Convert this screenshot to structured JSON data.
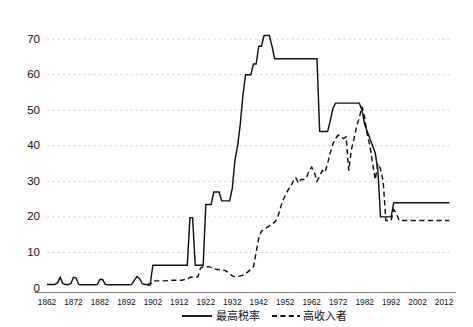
{
  "chart_data": {
    "type": "line",
    "title": "",
    "subtitle": "",
    "xlabel": "",
    "ylabel": "",
    "xlim": [
      1862,
      2015
    ],
    "ylim": [
      0,
      72
    ],
    "grid": true,
    "grid_axis": "y",
    "legend_position": "bottom-center",
    "y_ticks": [
      0,
      10,
      20,
      30,
      40,
      50,
      60,
      70
    ],
    "x_ticks": [
      1862,
      1872,
      1882,
      1892,
      1902,
      1912,
      1922,
      1932,
      1942,
      1952,
      1962,
      1972,
      1982,
      1992,
      2002,
      2012
    ],
    "series": [
      {
        "name": "最高税率",
        "style": "solid",
        "color": "#121212",
        "points": [
          [
            1862,
            1.0
          ],
          [
            1863,
            1.0
          ],
          [
            1864,
            1.0
          ],
          [
            1865,
            1.0
          ],
          [
            1866,
            1.5
          ],
          [
            1867,
            3.0
          ],
          [
            1868,
            1.2
          ],
          [
            1869,
            1.0
          ],
          [
            1870,
            1.0
          ],
          [
            1871,
            1.2
          ],
          [
            1872,
            3.0
          ],
          [
            1873,
            2.8
          ],
          [
            1874,
            1.0
          ],
          [
            1875,
            0.9
          ],
          [
            1876,
            0.9
          ],
          [
            1877,
            0.9
          ],
          [
            1878,
            0.9
          ],
          [
            1879,
            0.9
          ],
          [
            1880,
            0.9
          ],
          [
            1881,
            1.0
          ],
          [
            1882,
            2.4
          ],
          [
            1883,
            2.4
          ],
          [
            1884,
            1.0
          ],
          [
            1885,
            0.9
          ],
          [
            1886,
            0.9
          ],
          [
            1887,
            0.9
          ],
          [
            1888,
            0.9
          ],
          [
            1889,
            0.9
          ],
          [
            1890,
            0.9
          ],
          [
            1891,
            0.9
          ],
          [
            1892,
            0.9
          ],
          [
            1893,
            0.9
          ],
          [
            1894,
            1.0
          ],
          [
            1895,
            2.2
          ],
          [
            1896,
            3.2
          ],
          [
            1897,
            2.6
          ],
          [
            1898,
            1.2
          ],
          [
            1899,
            1.0
          ],
          [
            1900,
            1.0
          ],
          [
            1901,
            1.2
          ],
          [
            1902,
            6.4
          ],
          [
            1903,
            6.4
          ],
          [
            1904,
            6.4
          ],
          [
            1905,
            6.4
          ],
          [
            1906,
            6.4
          ],
          [
            1907,
            6.4
          ],
          [
            1908,
            6.4
          ],
          [
            1909,
            6.4
          ],
          [
            1910,
            6.4
          ],
          [
            1911,
            6.4
          ],
          [
            1912,
            6.4
          ],
          [
            1913,
            6.4
          ],
          [
            1914,
            6.4
          ],
          [
            1915,
            6.4
          ],
          [
            1916,
            19.8
          ],
          [
            1917,
            19.8
          ],
          [
            1918,
            6.4
          ],
          [
            1919,
            6.4
          ],
          [
            1920,
            6.4
          ],
          [
            1921,
            6.4
          ],
          [
            1922,
            23.5
          ],
          [
            1923,
            23.5
          ],
          [
            1924,
            23.5
          ],
          [
            1925,
            27.0
          ],
          [
            1926,
            27.0
          ],
          [
            1927,
            27.0
          ],
          [
            1928,
            24.5
          ],
          [
            1929,
            24.5
          ],
          [
            1930,
            24.5
          ],
          [
            1931,
            24.5
          ],
          [
            1932,
            28.0
          ],
          [
            1933,
            36.0
          ],
          [
            1934,
            40.0
          ],
          [
            1935,
            46.0
          ],
          [
            1936,
            54.0
          ],
          [
            1937,
            60.0
          ],
          [
            1938,
            60.0
          ],
          [
            1939,
            60.0
          ],
          [
            1940,
            63.0
          ],
          [
            1941,
            63.0
          ],
          [
            1942,
            68.0
          ],
          [
            1943,
            68.0
          ],
          [
            1944,
            71.0
          ],
          [
            1945,
            71.0
          ],
          [
            1946,
            71.0
          ],
          [
            1947,
            68.0
          ],
          [
            1948,
            64.5
          ],
          [
            1949,
            64.5
          ],
          [
            1950,
            64.5
          ],
          [
            1951,
            64.5
          ],
          [
            1952,
            64.5
          ],
          [
            1953,
            64.5
          ],
          [
            1954,
            64.5
          ],
          [
            1955,
            64.5
          ],
          [
            1956,
            64.5
          ],
          [
            1957,
            64.5
          ],
          [
            1958,
            64.5
          ],
          [
            1959,
            64.5
          ],
          [
            1960,
            64.5
          ],
          [
            1961,
            64.5
          ],
          [
            1962,
            64.5
          ],
          [
            1963,
            64.5
          ],
          [
            1964,
            64.5
          ],
          [
            1965,
            44.0
          ],
          [
            1966,
            44.0
          ],
          [
            1967,
            44.0
          ],
          [
            1968,
            44.0
          ],
          [
            1969,
            47.0
          ],
          [
            1970,
            50.5
          ],
          [
            1971,
            52.0
          ],
          [
            1972,
            52.0
          ],
          [
            1973,
            52.0
          ],
          [
            1974,
            52.0
          ],
          [
            1975,
            52.0
          ],
          [
            1976,
            52.0
          ],
          [
            1977,
            52.0
          ],
          [
            1978,
            52.0
          ],
          [
            1979,
            52.0
          ],
          [
            1980,
            52.0
          ],
          [
            1981,
            50.0
          ],
          [
            1982,
            46.0
          ],
          [
            1983,
            44.0
          ],
          [
            1984,
            42.0
          ],
          [
            1985,
            40.0
          ],
          [
            1986,
            38.0
          ],
          [
            1987,
            33.0
          ],
          [
            1988,
            20.0
          ],
          [
            1989,
            20.0
          ],
          [
            1990,
            20.0
          ],
          [
            1991,
            20.0
          ],
          [
            1992,
            20.0
          ],
          [
            1993,
            24.0
          ],
          [
            1994,
            24.0
          ],
          [
            1995,
            24.0
          ],
          [
            1996,
            24.0
          ],
          [
            1997,
            24.0
          ],
          [
            1998,
            24.0
          ],
          [
            1999,
            24.0
          ],
          [
            2000,
            24.0
          ],
          [
            2001,
            24.0
          ],
          [
            2002,
            24.0
          ],
          [
            2003,
            24.0
          ],
          [
            2004,
            24.0
          ],
          [
            2005,
            24.0
          ],
          [
            2006,
            24.0
          ],
          [
            2007,
            24.0
          ],
          [
            2008,
            24.0
          ],
          [
            2009,
            24.0
          ],
          [
            2010,
            24.0
          ],
          [
            2011,
            24.0
          ],
          [
            2012,
            24.0
          ],
          [
            2013,
            24.0
          ],
          [
            2014,
            24.0
          ]
        ]
      },
      {
        "name": "高收入者",
        "style": "dashed",
        "color": "#121212",
        "points": [
          [
            1900,
            0.8
          ],
          [
            1901,
            0.9
          ],
          [
            1902,
            2.0
          ],
          [
            1903,
            2.0
          ],
          [
            1904,
            2.0
          ],
          [
            1905,
            2.0
          ],
          [
            1906,
            2.0
          ],
          [
            1907,
            2.0
          ],
          [
            1908,
            2.2
          ],
          [
            1909,
            2.2
          ],
          [
            1910,
            2.2
          ],
          [
            1911,
            2.2
          ],
          [
            1912,
            2.2
          ],
          [
            1913,
            2.2
          ],
          [
            1914,
            2.4
          ],
          [
            1915,
            2.4
          ],
          [
            1916,
            3.0
          ],
          [
            1917,
            3.0
          ],
          [
            1918,
            3.0
          ],
          [
            1919,
            3.2
          ],
          [
            1920,
            5.6
          ],
          [
            1921,
            6.0
          ],
          [
            1922,
            6.0
          ],
          [
            1923,
            6.0
          ],
          [
            1924,
            5.8
          ],
          [
            1925,
            5.5
          ],
          [
            1926,
            5.2
          ],
          [
            1927,
            5.2
          ],
          [
            1928,
            5.0
          ],
          [
            1929,
            5.0
          ],
          [
            1930,
            4.6
          ],
          [
            1931,
            4.0
          ],
          [
            1932,
            3.4
          ],
          [
            1933,
            3.2
          ],
          [
            1934,
            3.2
          ],
          [
            1935,
            3.4
          ],
          [
            1936,
            3.6
          ],
          [
            1937,
            4.0
          ],
          [
            1938,
            4.6
          ],
          [
            1939,
            5.2
          ],
          [
            1940,
            6.0
          ],
          [
            1941,
            10.0
          ],
          [
            1942,
            14.0
          ],
          [
            1943,
            16.0
          ],
          [
            1944,
            16.5
          ],
          [
            1945,
            17.0
          ],
          [
            1946,
            17.5
          ],
          [
            1947,
            18.0
          ],
          [
            1948,
            18.5
          ],
          [
            1949,
            19.5
          ],
          [
            1950,
            22.0
          ],
          [
            1951,
            24.5
          ],
          [
            1952,
            26.0
          ],
          [
            1953,
            27.5
          ],
          [
            1954,
            28.5
          ],
          [
            1955,
            30.0
          ],
          [
            1956,
            31.0
          ],
          [
            1957,
            29.5
          ],
          [
            1958,
            30.5
          ],
          [
            1959,
            30.5
          ],
          [
            1960,
            31.0
          ],
          [
            1961,
            33.0
          ],
          [
            1962,
            34.0
          ],
          [
            1963,
            32.5
          ],
          [
            1964,
            30.0
          ],
          [
            1965,
            31.5
          ],
          [
            1966,
            33.0
          ],
          [
            1967,
            32.5
          ],
          [
            1968,
            35.0
          ],
          [
            1969,
            38.0
          ],
          [
            1970,
            40.5
          ],
          [
            1971,
            42.0
          ],
          [
            1972,
            43.0
          ],
          [
            1973,
            42.5
          ],
          [
            1974,
            42.0
          ],
          [
            1975,
            42.5
          ],
          [
            1976,
            33.0
          ],
          [
            1977,
            39.0
          ],
          [
            1978,
            42.0
          ],
          [
            1979,
            45.5
          ],
          [
            1980,
            48.0
          ],
          [
            1981,
            51.0
          ],
          [
            1982,
            48.0
          ],
          [
            1983,
            43.0
          ],
          [
            1984,
            40.0
          ],
          [
            1985,
            35.0
          ],
          [
            1986,
            30.5
          ],
          [
            1987,
            35.0
          ],
          [
            1988,
            33.5
          ],
          [
            1989,
            30.0
          ],
          [
            1990,
            19.0
          ],
          [
            1991,
            19.0
          ],
          [
            1992,
            19.0
          ],
          [
            1993,
            22.0
          ],
          [
            1994,
            21.0
          ],
          [
            1995,
            19.0
          ],
          [
            1996,
            19.0
          ],
          [
            1997,
            19.0
          ],
          [
            1998,
            19.0
          ],
          [
            1999,
            19.0
          ],
          [
            2000,
            19.0
          ],
          [
            2001,
            19.0
          ],
          [
            2002,
            19.0
          ],
          [
            2003,
            19.0
          ],
          [
            2004,
            19.0
          ],
          [
            2005,
            19.0
          ],
          [
            2006,
            19.0
          ],
          [
            2007,
            19.0
          ],
          [
            2008,
            19.0
          ],
          [
            2009,
            19.0
          ],
          [
            2010,
            19.0
          ],
          [
            2011,
            19.0
          ],
          [
            2012,
            19.0
          ],
          [
            2013,
            19.0
          ],
          [
            2014,
            19.0
          ]
        ]
      }
    ],
    "legend": [
      {
        "label": "最高税率",
        "style": "solid"
      },
      {
        "label": "高收入者",
        "style": "dashed"
      }
    ]
  },
  "axis": {
    "y_labels": [
      "0",
      "10",
      "20",
      "30",
      "40",
      "50",
      "60",
      "70"
    ],
    "x_labels": [
      "1862",
      "1872",
      "1882",
      "1892",
      "1902",
      "1912",
      "1922",
      "1932",
      "1942",
      "1952",
      "1962",
      "1972",
      "1982",
      "1992",
      "2002",
      "2012"
    ]
  },
  "legend": {
    "series_1_label": "最高税率",
    "series_2_label": "高收入者"
  },
  "colors": {
    "line": "#121212",
    "grid": "#c9c9c9",
    "axis": "#6f6f6f",
    "background": "#ffffff"
  }
}
